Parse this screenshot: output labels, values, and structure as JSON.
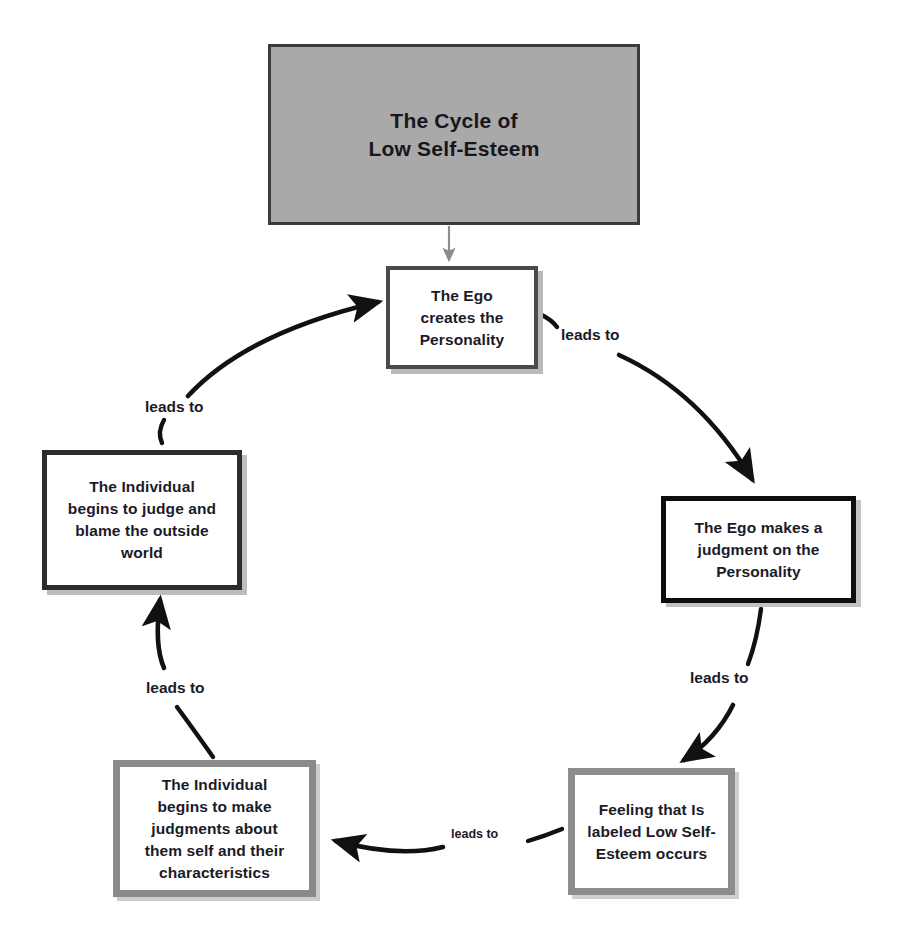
{
  "diagram": {
    "title_line1": "The Cycle of",
    "title_line2": "Low Self-Esteem",
    "title_full": "The Cycle of Low Self-Esteem",
    "colors": {
      "title_fill": "#a9a9a9",
      "title_border": "#3b3b3b",
      "node_fill": "#ffffff",
      "node_border_dark": "#0d0d0d",
      "node_border_gray": "#8a8a8a",
      "node_shadow": "#c2c2c2",
      "text": "#1b1b28",
      "arrow": "#111111",
      "entry_arrow": "#8c8c8c",
      "page_background": "#ffffff"
    },
    "nodes": [
      {
        "id": "ego-creates",
        "text": "The Ego creates the Personality",
        "lines": [
          "The Ego",
          "creates the",
          "Personality"
        ]
      },
      {
        "id": "ego-judges",
        "text": "The Ego makes a judgment on the Personality",
        "lines": [
          "The Ego makes a",
          "judgment on the",
          "Personality"
        ]
      },
      {
        "id": "feeling-labeled",
        "text": "Feeling that Is labeled Low Self-Esteem occurs",
        "lines": [
          "Feeling that Is",
          "labeled Low Self-",
          "Esteem occurs"
        ]
      },
      {
        "id": "individual-judges-self",
        "text": "The Individual begins to make judgments about them self and their characteristics",
        "lines": [
          "The Individual",
          "begins to make",
          "judgments about",
          "them self and their",
          "characteristics"
        ]
      },
      {
        "id": "individual-blames-world",
        "text": "The Individual begins to judge and blame the outside world",
        "lines": [
          "The Individual",
          "begins to judge and",
          "blame the outside",
          "world"
        ]
      }
    ],
    "edges": [
      {
        "id": "title-to-ego-creates",
        "label": "",
        "from": "title",
        "to": "ego-creates"
      },
      {
        "id": "ego-creates-to-ego-judges",
        "label": "leads to",
        "from": "ego-creates",
        "to": "ego-judges"
      },
      {
        "id": "ego-judges-to-feeling",
        "label": "leads to",
        "from": "ego-judges",
        "to": "feeling-labeled"
      },
      {
        "id": "feeling-to-individual-judges-self",
        "label": "leads to",
        "from": "feeling-labeled",
        "to": "individual-judges-self"
      },
      {
        "id": "individual-judges-self-to-blames-world",
        "label": "leads to",
        "from": "individual-judges-self",
        "to": "individual-blames-world"
      },
      {
        "id": "blames-world-to-ego-creates",
        "label": "leads to",
        "from": "individual-blames-world",
        "to": "ego-creates"
      }
    ]
  }
}
